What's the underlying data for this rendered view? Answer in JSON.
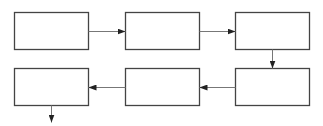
{
  "diagram": {
    "type": "serpentine-flowchart",
    "stroke_color": "#444444",
    "background": "#ffffff",
    "boxes": [
      {
        "id": "box-1",
        "label": "",
        "x": 14,
        "y": 12,
        "w": 74,
        "h": 37
      },
      {
        "id": "box-2",
        "label": "",
        "x": 125,
        "y": 12,
        "w": 74,
        "h": 37
      },
      {
        "id": "box-3",
        "label": "",
        "x": 235,
        "y": 12,
        "w": 74,
        "h": 37
      },
      {
        "id": "box-4",
        "label": "",
        "x": 235,
        "y": 68,
        "w": 74,
        "h": 37
      },
      {
        "id": "box-5",
        "label": "",
        "x": 125,
        "y": 68,
        "w": 74,
        "h": 37
      },
      {
        "id": "box-6",
        "label": "",
        "x": 14,
        "y": 68,
        "w": 74,
        "h": 37
      }
    ],
    "arrows": [
      {
        "from": "box-1",
        "to": "box-2",
        "x1": 88,
        "y1": 31,
        "x2": 125,
        "y2": 31
      },
      {
        "from": "box-2",
        "to": "box-3",
        "x1": 199,
        "y1": 31,
        "x2": 235,
        "y2": 31
      },
      {
        "from": "box-3",
        "to": "box-4",
        "x1": 272,
        "y1": 49,
        "x2": 272,
        "y2": 68
      },
      {
        "from": "box-4",
        "to": "box-5",
        "x1": 235,
        "y1": 87,
        "x2": 199,
        "y2": 87
      },
      {
        "from": "box-5",
        "to": "box-6",
        "x1": 125,
        "y1": 87,
        "x2": 88,
        "y2": 87
      },
      {
        "from": "box-6",
        "to": "exit",
        "x1": 51,
        "y1": 105,
        "x2": 51,
        "y2": 122
      }
    ]
  }
}
